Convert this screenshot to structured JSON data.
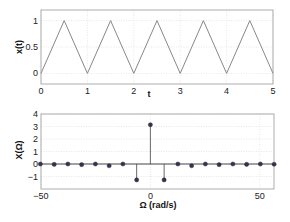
{
  "chart_data": [
    {
      "type": "line",
      "title": "",
      "xlabel": "t",
      "ylabel": "x(t)",
      "xlim": [
        0,
        5
      ],
      "ylim": [
        -0.2,
        1.2
      ],
      "xticks": [
        0,
        1,
        2,
        3,
        4,
        5
      ],
      "yticks": [
        0,
        0.5,
        1
      ],
      "ytick_labels": [
        "0",
        "0.5",
        "1"
      ],
      "grid": true,
      "series": [
        {
          "name": "x(t)",
          "color": "#888888",
          "x": [
            0,
            0.5,
            1,
            1.5,
            2,
            2.5,
            3,
            3.5,
            4,
            4.5,
            5
          ],
          "y": [
            0,
            1,
            0,
            1,
            0,
            1,
            0,
            1,
            0,
            1,
            0
          ]
        }
      ]
    },
    {
      "type": "stem",
      "title": "",
      "xlabel": "Ω (rad/s)",
      "ylabel": "X(Ω)",
      "xlim": [
        -50,
        56.5
      ],
      "ylim": [
        -2,
        4
      ],
      "xticks": [
        -50,
        0,
        50
      ],
      "yticks": [
        -1,
        0,
        1,
        2,
        3,
        4
      ],
      "ytick_labels": [
        "-1",
        "0",
        "1",
        "2",
        "3",
        "4"
      ],
      "grid": true,
      "series": [
        {
          "name": "X(Ω)",
          "color": "#333355",
          "x": [
            -50.27,
            -43.98,
            -37.7,
            -31.42,
            -25.13,
            -18.85,
            -12.57,
            -6.28,
            0,
            6.28,
            12.57,
            18.85,
            25.13,
            31.42,
            37.7,
            43.98,
            50.27,
            56.55
          ],
          "y": [
            0,
            -0.03,
            0,
            -0.05,
            0,
            -0.14,
            0,
            -1.27,
            3.14,
            -1.27,
            0,
            -0.14,
            0,
            -0.05,
            0,
            -0.03,
            0,
            -0.02
          ]
        }
      ]
    }
  ]
}
